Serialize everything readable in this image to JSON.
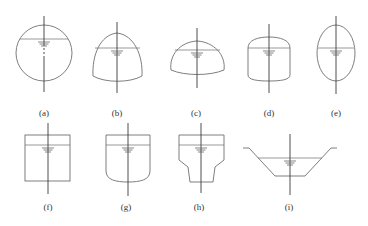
{
  "figure": {
    "panels": [
      {
        "id": "a",
        "label": "(a)",
        "shape": "circle"
      },
      {
        "id": "b",
        "label": "(b)",
        "shape": "dome-bottom-curved"
      },
      {
        "id": "c",
        "label": "(c)",
        "shape": "hemisphere-dome"
      },
      {
        "id": "d",
        "label": "(d)",
        "shape": "rounded-top-rectangle"
      },
      {
        "id": "e",
        "label": "(e)",
        "shape": "ellipse"
      },
      {
        "id": "f",
        "label": "(f)",
        "shape": "rectangle"
      },
      {
        "id": "g",
        "label": "(g)",
        "shape": "rounded-bottom-rectangle"
      },
      {
        "id": "h",
        "label": "(h)",
        "shape": "hopper"
      },
      {
        "id": "i",
        "label": "(i)",
        "shape": "trapezoidal-channel"
      }
    ]
  },
  "colors": {
    "outline": "#6f6f6f",
    "axis": "#3a3a3a",
    "background": "#ffffff"
  }
}
